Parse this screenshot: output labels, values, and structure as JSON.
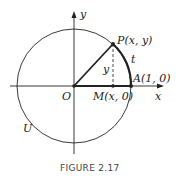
{
  "figure": {
    "caption": "FIGURE 2.17",
    "labels": {
      "y_axis": "y",
      "x_axis": "x",
      "origin": "O",
      "point_p": "P(x, y)",
      "point_a": "A(1, 0)",
      "point_m": "M(x, 0)",
      "arc": "t",
      "segment_y": "y",
      "circle": "U"
    }
  }
}
